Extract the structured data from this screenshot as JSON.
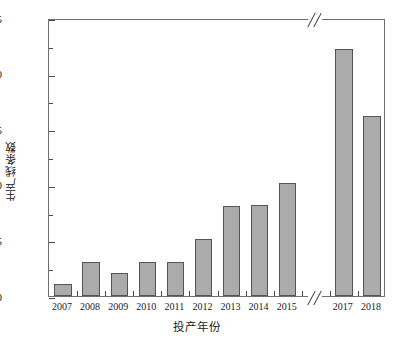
{
  "chart_data": {
    "type": "bar",
    "title": "",
    "subtitle": "",
    "xlabel": "投产年份",
    "ylabel": "生产线条数",
    "categories": [
      "2007",
      "2008",
      "2009",
      "2010",
      "2011",
      "2012",
      "2013",
      "2014",
      "2015",
      "2017",
      "2018"
    ],
    "values": [
      1.1,
      3.1,
      2.1,
      3.1,
      3.1,
      5.15,
      8.1,
      8.15,
      10.2,
      22.2,
      16.2
    ],
    "ylim": [
      0,
      25
    ],
    "y_major_ticks": [
      0,
      5,
      10,
      15,
      20,
      25
    ],
    "y_minor_ticks": [
      2.5,
      7.5,
      12.5,
      17.5,
      22.5
    ],
    "y_tick_labels": [
      "0",
      "5",
      "10",
      "15",
      "20",
      "25"
    ],
    "grid": false,
    "legend": null,
    "legend_position": "none",
    "axis_break": {
      "present": true,
      "axis": "x",
      "between": [
        "2015",
        "2017"
      ],
      "missing_category": "2016",
      "marker": "//"
    },
    "bar_color": "#ababab",
    "bar_edge_color": "#555555",
    "frame_color": "#6f6f6f",
    "text_color": "#1c1c1c"
  }
}
